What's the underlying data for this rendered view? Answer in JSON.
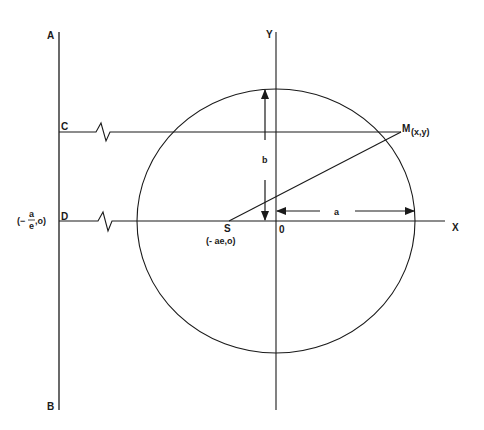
{
  "diagram": {
    "points": {
      "A": "A",
      "B": "B",
      "C": "C",
      "D": "D",
      "S": "S",
      "S_coords": "(- ae,o)",
      "O": "0",
      "M": "M",
      "M_coords": "(x,y)",
      "X": "X",
      "Y": "Y"
    },
    "directrix_point": {
      "prefix": "(−",
      "numerator": "a",
      "denominator": "e",
      "suffix": ",o)"
    },
    "dimensions": {
      "semi_major": "a",
      "semi_minor": "b"
    },
    "colors": {
      "line": "#1a1a1a",
      "background": "#ffffff"
    }
  }
}
